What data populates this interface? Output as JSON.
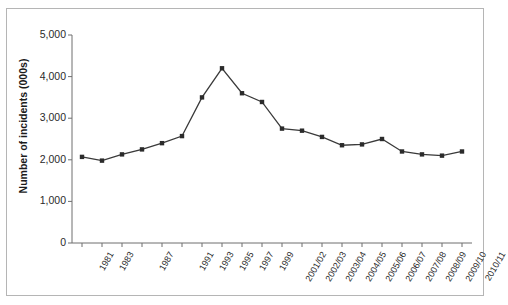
{
  "chart_data": {
    "type": "line",
    "title": "",
    "xlabel": "",
    "ylabel": "Number of incidents (000s)",
    "ylim": [
      0,
      5000
    ],
    "ytick_labels": [
      "0",
      "1,000",
      "2,000",
      "3,000",
      "4,000",
      "5,000"
    ],
    "ytick_values": [
      0,
      1000,
      2000,
      3000,
      4000,
      5000
    ],
    "grid": false,
    "legend": "none",
    "marker": "square",
    "line_color": "#3a3a3a",
    "marker_color": "#2b2b2b",
    "categories": [
      "1981",
      "1983",
      "1985",
      "1987",
      "1989",
      "1991",
      "1993",
      "1995",
      "1997",
      "1999",
      "2001/02",
      "2002/03",
      "2003/04",
      "2004/05",
      "2005/06",
      "2006/07",
      "2007/08",
      "2008/09",
      "2009/10",
      "2010/11"
    ],
    "visible_tick_labels": [
      "1981",
      "1983",
      "1987",
      "1991",
      "1993",
      "1995",
      "1997",
      "1999",
      "2001/02",
      "2002/03",
      "2003/04",
      "2004/05",
      "2005/06",
      "2006/07",
      "2007/08",
      "2008/09",
      "2009/10",
      "2010/11"
    ],
    "values": [
      2070,
      1980,
      2130,
      2250,
      2400,
      2570,
      3500,
      4200,
      3600,
      3390,
      2750,
      2700,
      2550,
      2350,
      2370,
      2500,
      2200,
      2130,
      2100,
      2200
    ]
  }
}
